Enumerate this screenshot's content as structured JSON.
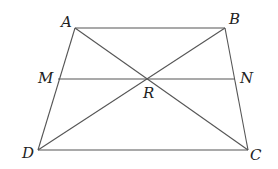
{
  "diagram": {
    "type": "trapezoid",
    "colors": {
      "line": "#555555",
      "label": "#222222",
      "background": "#ffffff"
    },
    "points": {
      "A": {
        "label": "A",
        "x": 75,
        "y": 28
      },
      "B": {
        "label": "B",
        "x": 225,
        "y": 28
      },
      "M": {
        "label": "M",
        "x": 58,
        "y": 79
      },
      "N": {
        "label": "N",
        "x": 235,
        "y": 79
      },
      "R": {
        "label": "R",
        "x": 148,
        "y": 79
      },
      "D": {
        "label": "D",
        "x": 38,
        "y": 150
      },
      "C": {
        "label": "C",
        "x": 248,
        "y": 150
      }
    },
    "segments": [
      [
        "A",
        "B"
      ],
      [
        "B",
        "C"
      ],
      [
        "C",
        "D"
      ],
      [
        "D",
        "A"
      ],
      [
        "A",
        "C"
      ],
      [
        "B",
        "D"
      ],
      [
        "M",
        "N"
      ]
    ]
  }
}
